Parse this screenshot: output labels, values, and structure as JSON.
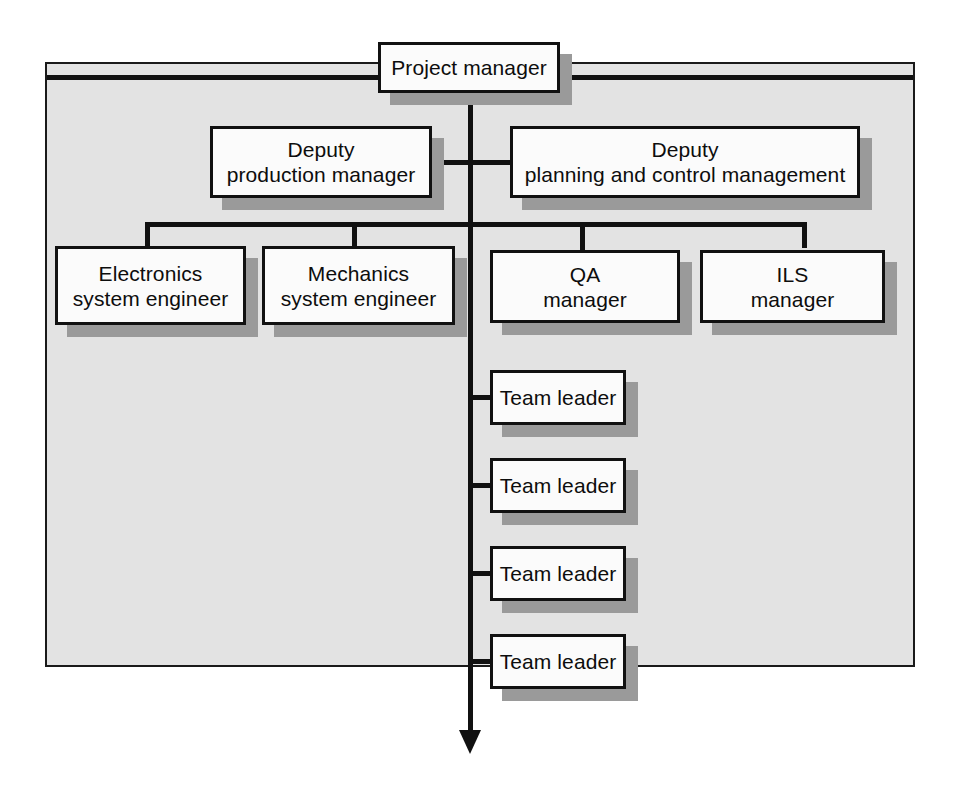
{
  "diagram": {
    "type": "organization-chart",
    "panel": {
      "fill_color": "#e3e3e3",
      "border_color": "#1a1a1a"
    },
    "node_style": {
      "fill_color": "#fbfbfb",
      "border_color": "#111111",
      "shadow_color": "#9a9a9a"
    },
    "connector_color": "#111111",
    "nodes": [
      {
        "id": "project-manager",
        "label": "Project manager",
        "level": 1
      },
      {
        "id": "deputy-production-manager",
        "label": "Deputy\nproduction manager",
        "level": 2
      },
      {
        "id": "deputy-planning-and-control-management",
        "label": "Deputy\nplanning and control management",
        "level": 2
      },
      {
        "id": "electronics-system-engineer",
        "label": "Electronics\nsystem engineer",
        "level": 3
      },
      {
        "id": "mechanics-system-engineer",
        "label": "Mechanics\nsystem engineer",
        "level": 3
      },
      {
        "id": "qa-manager",
        "label": "QA\nmanager",
        "level": 3
      },
      {
        "id": "ils-manager",
        "label": "ILS\nmanager",
        "level": 3
      },
      {
        "id": "team-leader-1",
        "label": "Team leader",
        "level": 4
      },
      {
        "id": "team-leader-2",
        "label": "Team leader",
        "level": 4
      },
      {
        "id": "team-leader-3",
        "label": "Team leader",
        "level": 4
      },
      {
        "id": "team-leader-4",
        "label": "Team leader",
        "level": 4
      }
    ],
    "edges": [
      {
        "from": "project-manager",
        "to": "deputy-production-manager"
      },
      {
        "from": "project-manager",
        "to": "deputy-planning-and-control-management"
      },
      {
        "from": "project-manager",
        "to": "electronics-system-engineer"
      },
      {
        "from": "project-manager",
        "to": "mechanics-system-engineer"
      },
      {
        "from": "project-manager",
        "to": "qa-manager"
      },
      {
        "from": "project-manager",
        "to": "ils-manager"
      },
      {
        "from": "project-manager",
        "to": "team-leader-1"
      },
      {
        "from": "project-manager",
        "to": "team-leader-2"
      },
      {
        "from": "project-manager",
        "to": "team-leader-3"
      },
      {
        "from": "project-manager",
        "to": "team-leader-4"
      },
      {
        "from": "project-manager",
        "to": "continuation-arrow",
        "style": "arrow-down"
      }
    ]
  },
  "background_text": {
    "note": "faint show-through text from the reverse of the printed page",
    "lines_left": "",
    "lines_right": ""
  }
}
